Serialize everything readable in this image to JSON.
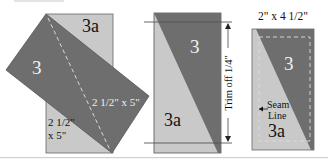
{
  "colors": {
    "dark_fabric": "#6e6e6e",
    "light_fabric": "#c9c9c9",
    "outline": "#555555",
    "dashed_line": "#d8d8d8",
    "text_dark": "#111111",
    "text_light": "#f2f2f2",
    "background": "#ffffff"
  },
  "panel1": {
    "dark_label": "3",
    "light_label": "3a",
    "dark_size_label": "2 1/2\" x 5\"",
    "light_size_line1": "2 1/2\"",
    "light_size_line2": "x 5\""
  },
  "panel2": {
    "dark_label": "3",
    "light_label": "3a",
    "trim_label": "Trim off 1/4\""
  },
  "panel3": {
    "title": "2\" x 4 1/2\"",
    "dark_label": "3",
    "light_label": "3a",
    "seam_line1": "Seam",
    "seam_line2": "Line"
  }
}
